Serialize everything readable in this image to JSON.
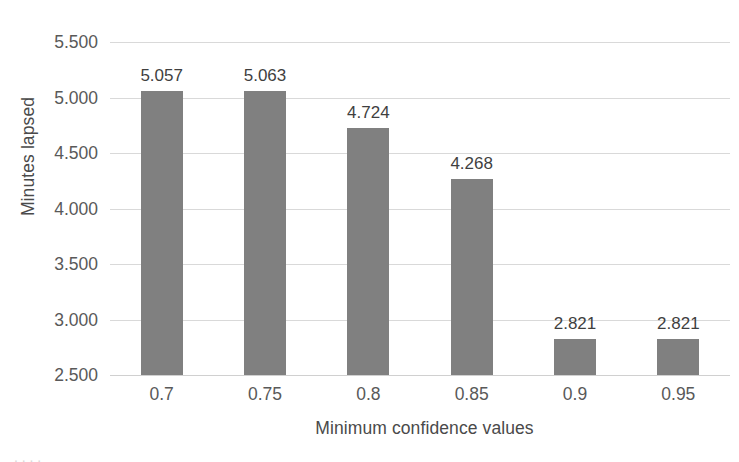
{
  "chart_data": {
    "type": "bar",
    "title": "",
    "xlabel": "Minimum confidence values",
    "ylabel": "Minutes lapsed",
    "categories": [
      "0.7",
      "0.75",
      "0.8",
      "0.85",
      "0.9",
      "0.95"
    ],
    "values": [
      5.057,
      5.063,
      4.724,
      4.268,
      2.821,
      2.821
    ],
    "data_labels": [
      "5.057",
      "5.063",
      "4.724",
      "4.268",
      "2.821",
      "2.821"
    ],
    "ylim": [
      2.5,
      5.5
    ],
    "ytick_values": [
      5.5,
      5.0,
      4.5,
      4.0,
      3.5,
      3.0,
      2.5
    ],
    "ytick_labels": [
      "5.500",
      "5.000",
      "4.500",
      "4.000",
      "3.500",
      "3.000",
      "2.500"
    ],
    "grid": true,
    "legend": false,
    "bar_color": "#808080",
    "gridline_color": "#d9d9d9",
    "text_color": "#595959",
    "background_color": "#ffffff"
  },
  "caption_fragment": "   .  .                            .                   ."
}
